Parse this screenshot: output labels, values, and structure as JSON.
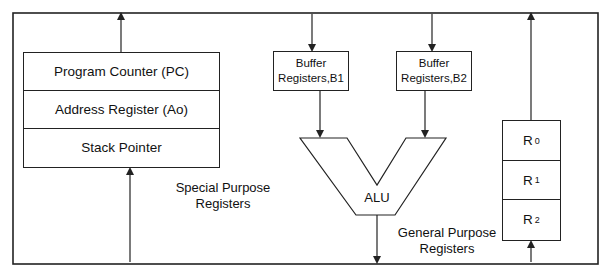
{
  "diagram": {
    "title": "",
    "special_purpose": {
      "label_line1": "Special Purpose",
      "label_line2": "Registers",
      "registers": [
        {
          "label": "Program Counter (PC)"
        },
        {
          "label": "Address Register (Ao)"
        },
        {
          "label": "Stack Pointer"
        }
      ]
    },
    "buffers": [
      {
        "line1": "Buffer",
        "line2": "Registers,B1"
      },
      {
        "line1": "Buffer",
        "line2": "Registers,B2"
      }
    ],
    "alu": {
      "label": "ALU"
    },
    "general_purpose": {
      "label_line1": "General Purpose",
      "label_line2": "Registers",
      "registers": [
        {
          "name": "R",
          "index": "0"
        },
        {
          "name": "R",
          "index": "1"
        },
        {
          "name": "R",
          "index": "2"
        }
      ]
    },
    "colors": {
      "line": "#222222",
      "background": "#ffffff"
    }
  }
}
